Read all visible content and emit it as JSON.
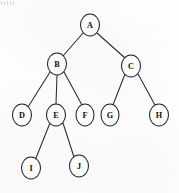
{
  "diagram": {
    "type": "tree",
    "node_shape": "ellipse",
    "colors": {
      "background": "#fdfdfd",
      "node_fill": "#ffffff",
      "node_stroke": "#232323",
      "edge_stroke": "#2b2b2b",
      "label_color": "#111111"
    },
    "root": "A",
    "nodes": [
      {
        "id": "A",
        "label": "A",
        "cx": 90,
        "cy": 25,
        "rx": 9.5,
        "ry": 11.0,
        "level": 0
      },
      {
        "id": "B",
        "label": "B",
        "cx": 57,
        "cy": 64,
        "rx": 9.5,
        "ry": 11.0,
        "level": 1
      },
      {
        "id": "C",
        "label": "C",
        "cx": 131,
        "cy": 66,
        "rx": 9.5,
        "ry": 11.0,
        "level": 1
      },
      {
        "id": "D",
        "label": "D",
        "cx": 22,
        "cy": 115,
        "rx": 9.5,
        "ry": 11.0,
        "level": 2
      },
      {
        "id": "E",
        "label": "E",
        "cx": 56,
        "cy": 115,
        "rx": 9.5,
        "ry": 11.0,
        "level": 2
      },
      {
        "id": "F",
        "label": "F",
        "cx": 85,
        "cy": 115,
        "rx": 9.0,
        "ry": 11.0,
        "level": 2
      },
      {
        "id": "G",
        "label": "G",
        "cx": 110,
        "cy": 115,
        "rx": 9.0,
        "ry": 11.0,
        "level": 2
      },
      {
        "id": "H",
        "label": "H",
        "cx": 159,
        "cy": 115,
        "rx": 9.5,
        "ry": 11.0,
        "level": 2
      },
      {
        "id": "I",
        "label": "I",
        "cx": 31,
        "cy": 168,
        "rx": 9.5,
        "ry": 11.0,
        "level": 3
      },
      {
        "id": "J",
        "label": "J",
        "cx": 79,
        "cy": 166,
        "rx": 9.5,
        "ry": 11.0,
        "level": 3
      }
    ],
    "edges": [
      {
        "from": "A",
        "to": "B",
        "x1": 83,
        "y1": 33,
        "x2": 63,
        "y2": 56
      },
      {
        "from": "A",
        "to": "C",
        "x1": 97,
        "y1": 33,
        "x2": 125,
        "y2": 58
      },
      {
        "from": "B",
        "to": "D",
        "x1": 50,
        "y1": 72,
        "x2": 28,
        "y2": 107
      },
      {
        "from": "B",
        "to": "E",
        "x1": 57,
        "y1": 75,
        "x2": 56,
        "y2": 104
      },
      {
        "from": "B",
        "to": "F",
        "x1": 64,
        "y1": 72,
        "x2": 82,
        "y2": 105
      },
      {
        "from": "C",
        "to": "G",
        "x1": 125,
        "y1": 74,
        "x2": 113,
        "y2": 105
      },
      {
        "from": "C",
        "to": "H",
        "x1": 138,
        "y1": 74,
        "x2": 155,
        "y2": 105
      },
      {
        "from": "E",
        "to": "I",
        "x1": 50,
        "y1": 123,
        "x2": 36,
        "y2": 158
      },
      {
        "from": "E",
        "to": "J",
        "x1": 63,
        "y1": 123,
        "x2": 74,
        "y2": 157
      }
    ],
    "adjacency": {
      "A": [
        "B",
        "C"
      ],
      "B": [
        "D",
        "E",
        "F"
      ],
      "C": [
        "G",
        "H"
      ],
      "D": [],
      "E": [
        "I",
        "J"
      ],
      "F": [],
      "G": [],
      "H": [],
      "I": [],
      "J": []
    },
    "node_count": 10,
    "edge_count": 9,
    "depth": 4
  }
}
